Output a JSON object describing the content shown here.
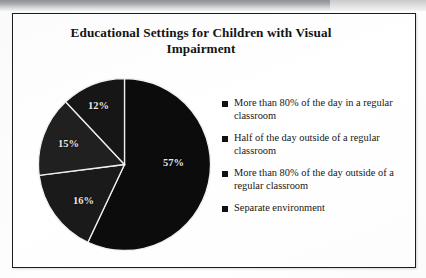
{
  "slide": {
    "title": "Educational Settings for Children with Visual Impairment",
    "title_line_1": "Educational Settings for Children with Visual",
    "title_line_2": "Impairment"
  },
  "chart_data": {
    "type": "pie",
    "title": "Educational Settings for Children with Visual Impairment",
    "xlabel": "",
    "ylabel": "",
    "legend_position": "right",
    "grid": false,
    "start_angle_deg": 0,
    "direction": "clockwise",
    "categories": [
      "More than 80% of the day in a regular classroom",
      "Half of the day outside of a regular classroom",
      "More than 80% of the day outside of a regular classroom",
      "Separate environment"
    ],
    "values": [
      57,
      16,
      15,
      12
    ],
    "labels": [
      "57%",
      "16%",
      "15%",
      "12%"
    ],
    "units": "percent",
    "colors": [
      "#0c0c0c",
      "#1a1a1a",
      "#202020",
      "#161616"
    ],
    "slice_separator_color": "#f0f0f0",
    "slices": [
      {
        "label": "57%",
        "value": 57,
        "category": "More than 80% of the day in a regular classroom"
      },
      {
        "label": "16%",
        "value": 16,
        "category": "Half of the day outside of a regular classroom"
      },
      {
        "label": "15%",
        "value": 15,
        "category": "More than 80% of the day outside of a regular classroom"
      },
      {
        "label": "12%",
        "value": 12,
        "category": "Separate environment"
      }
    ]
  },
  "legend": {
    "items": [
      {
        "label": "More than 80% of the day in a regular classroom"
      },
      {
        "label": "Half of the day outside of a regular classroom"
      },
      {
        "label": "More than 80% of the day outside of a regular classroom"
      },
      {
        "label": "Separate environment"
      }
    ]
  },
  "pie_labels": {
    "s1": "57%",
    "s2": "16%",
    "s3": "15%",
    "s4": "12%"
  }
}
